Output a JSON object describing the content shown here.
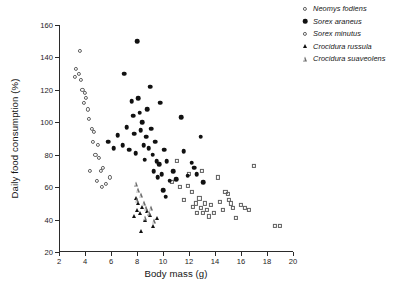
{
  "chart_data": {
    "type": "scatter",
    "title": "",
    "xlabel": "Body mass (g)",
    "ylabel": "Daily food consumption (%)",
    "xlim": [
      2,
      20
    ],
    "ylim": [
      20,
      160
    ],
    "xticks": [
      2,
      4,
      6,
      8,
      10,
      12,
      14,
      16,
      18,
      20
    ],
    "yticks": [
      20,
      40,
      60,
      80,
      100,
      120,
      140,
      160
    ],
    "grid": false,
    "legend_position": "top-right",
    "series": [
      {
        "name": "Neomys fodiens",
        "marker": "open-square",
        "color": "#5e5e5e",
        "points": [
          [
            11.1,
            76.0
          ],
          [
            11.3,
            60.0
          ],
          [
            11.6,
            52.0
          ],
          [
            11.9,
            61.0
          ],
          [
            12.2,
            57.0
          ],
          [
            12.3,
            48.0
          ],
          [
            12.5,
            50.0
          ],
          [
            12.6,
            44.0
          ],
          [
            12.8,
            53.0
          ],
          [
            12.9,
            47.0
          ],
          [
            13.1,
            44.0
          ],
          [
            13.2,
            50.0
          ],
          [
            13.4,
            46.0
          ],
          [
            13.5,
            42.0
          ],
          [
            13.7,
            49.0
          ],
          [
            13.9,
            44.0
          ],
          [
            14.2,
            66.0
          ],
          [
            14.4,
            51.0
          ],
          [
            14.6,
            46.0
          ],
          [
            14.8,
            57.0
          ],
          [
            15.0,
            56.0
          ],
          [
            15.1,
            52.0
          ],
          [
            15.2,
            50.0
          ],
          [
            15.4,
            47.0
          ],
          [
            15.6,
            41.0
          ],
          [
            16.0,
            49.0
          ],
          [
            16.3,
            47.0
          ],
          [
            16.6,
            46.0
          ],
          [
            17.0,
            73.0
          ],
          [
            18.6,
            36.0
          ],
          [
            19.0,
            36.0
          ],
          [
            10.7,
            63.0
          ],
          [
            12.0,
            68.0
          ],
          [
            13.0,
            70.0
          ]
        ]
      },
      {
        "name": "Sorex araneus",
        "marker": "filled-circle",
        "color": "#111111",
        "points": [
          [
            6.2,
            84.0
          ],
          [
            6.5,
            92.0
          ],
          [
            7.0,
            130.0
          ],
          [
            7.2,
            97.0
          ],
          [
            7.4,
            83.0
          ],
          [
            7.6,
            113.0
          ],
          [
            7.7,
            104.0
          ],
          [
            7.8,
            93.0
          ],
          [
            7.9,
            81.0
          ],
          [
            8.0,
            150.0
          ],
          [
            8.1,
            115.0
          ],
          [
            8.2,
            106.0
          ],
          [
            8.3,
            95.0
          ],
          [
            8.4,
            100.0
          ],
          [
            8.5,
            86.0
          ],
          [
            8.6,
            77.0
          ],
          [
            8.7,
            91.0
          ],
          [
            8.8,
            108.0
          ],
          [
            8.9,
            84.0
          ],
          [
            9.0,
            122.0
          ],
          [
            9.1,
            96.0
          ],
          [
            9.2,
            80.0
          ],
          [
            9.3,
            70.0
          ],
          [
            9.4,
            88.0
          ],
          [
            9.5,
            76.0
          ],
          [
            9.6,
            66.0
          ],
          [
            9.7,
            74.0
          ],
          [
            9.8,
            112.0
          ],
          [
            9.9,
            68.0
          ],
          [
            10.1,
            83.0
          ],
          [
            10.3,
            76.0
          ],
          [
            10.5,
            64.0
          ],
          [
            10.8,
            70.0
          ],
          [
            11.0,
            65.0
          ],
          [
            11.4,
            103.0
          ],
          [
            11.6,
            82.0
          ],
          [
            11.9,
            67.0
          ],
          [
            12.2,
            75.0
          ],
          [
            12.4,
            72.0
          ],
          [
            12.6,
            68.0
          ],
          [
            12.9,
            91.0
          ],
          [
            13.1,
            63.0
          ],
          [
            6.9,
            86.0
          ],
          [
            5.8,
            88.0
          ],
          [
            10.0,
            58.0
          ],
          [
            10.2,
            54.0
          ]
        ]
      },
      {
        "name": "Sorex minutus",
        "marker": "open-circle",
        "color": "#5e5e5e",
        "points": [
          [
            3.2,
            128.0
          ],
          [
            3.3,
            133.0
          ],
          [
            3.5,
            130.0
          ],
          [
            3.6,
            144.0
          ],
          [
            3.7,
            126.0
          ],
          [
            3.8,
            120.0
          ],
          [
            3.9,
            112.0
          ],
          [
            4.0,
            118.0
          ],
          [
            4.1,
            115.0
          ],
          [
            4.2,
            108.0
          ],
          [
            4.3,
            102.0
          ],
          [
            4.5,
            96.0
          ],
          [
            4.6,
            88.0
          ],
          [
            4.7,
            94.0
          ],
          [
            4.8,
            80.0
          ],
          [
            5.0,
            86.0
          ],
          [
            5.1,
            78.0
          ],
          [
            5.2,
            70.0
          ],
          [
            5.4,
            72.0
          ],
          [
            4.9,
            64.0
          ],
          [
            5.3,
            60.0
          ],
          [
            5.6,
            62.0
          ],
          [
            5.9,
            66.0
          ],
          [
            4.4,
            70.0
          ]
        ]
      },
      {
        "name": "Crocidura russula",
        "marker": "filled-triangle",
        "color": "#111111",
        "points": [
          [
            7.9,
            53.0
          ],
          [
            8.0,
            46.0
          ],
          [
            8.1,
            50.0
          ],
          [
            8.2,
            44.0
          ],
          [
            8.4,
            48.0
          ],
          [
            8.6,
            40.0
          ],
          [
            8.8,
            45.0
          ],
          [
            9.0,
            43.0
          ],
          [
            9.2,
            36.0
          ],
          [
            9.5,
            41.0
          ],
          [
            8.3,
            33.0
          ],
          [
            7.8,
            42.0
          ]
        ]
      },
      {
        "name": "Crocidura suaveolens",
        "marker": "open-triangle",
        "color": "#6d6d6d",
        "points": [
          [
            7.9,
            62.0
          ],
          [
            8.1,
            58.0
          ],
          [
            8.3,
            55.0
          ],
          [
            8.0,
            52.0
          ],
          [
            8.5,
            50.0
          ],
          [
            8.7,
            47.0
          ],
          [
            8.9,
            44.0
          ],
          [
            9.1,
            47.0
          ],
          [
            8.6,
            41.0
          ],
          [
            9.3,
            39.0
          ]
        ]
      }
    ]
  },
  "legend": {
    "items": [
      {
        "label": "Neomys fodiens",
        "marker": "open-circle"
      },
      {
        "label": "Sorex araneus",
        "marker": "filled-circle"
      },
      {
        "label": "Sorex minutus",
        "marker": "open-circle"
      },
      {
        "label": "Crocidura russula",
        "marker": "filled-triangle"
      },
      {
        "label": "Crocidura suaveolens",
        "marker": "open-triangle"
      }
    ]
  }
}
